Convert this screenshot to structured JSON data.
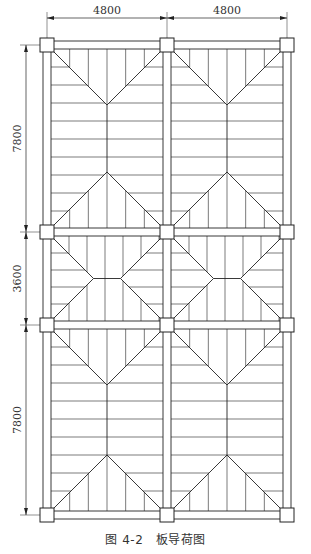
{
  "figure": {
    "caption_number": "图 4-2",
    "caption_title": "板导荷图"
  },
  "dimensions": {
    "horizontal": [
      "4800",
      "4800"
    ],
    "vertical": [
      "7800",
      "3600",
      "7800"
    ]
  },
  "grid": {
    "column_x": [
      47,
      167,
      287
    ],
    "row_y": [
      45,
      232,
      325,
      515
    ],
    "bays_x": 2,
    "bays_y": 3
  },
  "colors": {
    "line": "#222222",
    "background": "#ffffff"
  }
}
